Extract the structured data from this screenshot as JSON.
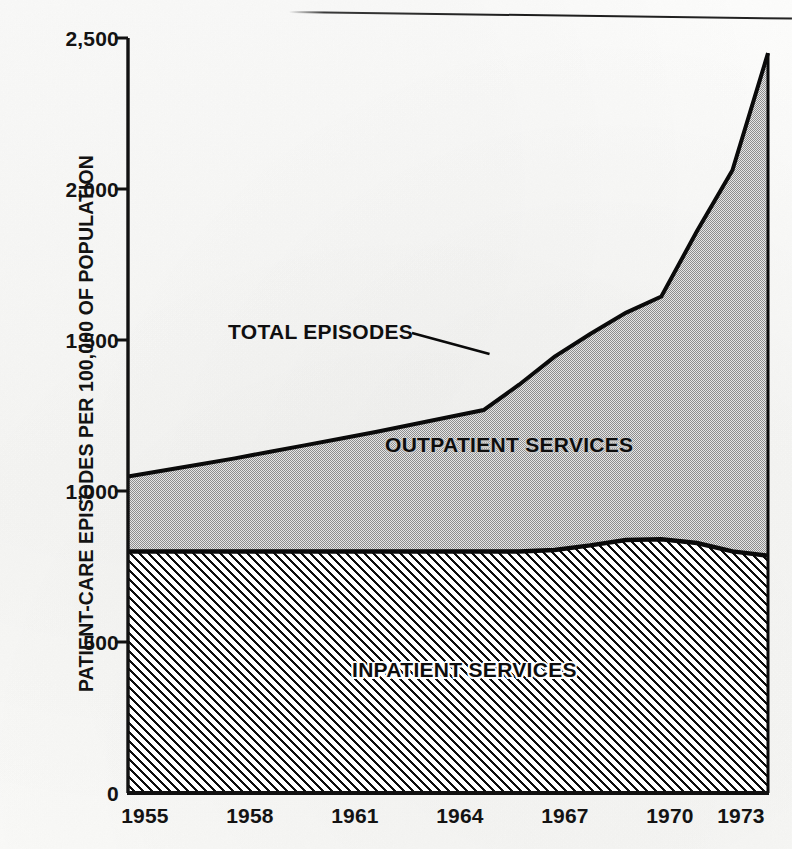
{
  "chart_data": {
    "type": "area",
    "title": "",
    "subtitle": "",
    "xlabel": "",
    "ylabel": "PATIENT-CARE EPISODES PER 100,000 OF POPULATION",
    "xlim": [
      1955,
      1973
    ],
    "ylim": [
      0,
      2500
    ],
    "grid": false,
    "legend_position": "inline-annotations",
    "stacked": true,
    "x": [
      1955,
      1956,
      1957,
      1958,
      1959,
      1960,
      1961,
      1962,
      1963,
      1964,
      1965,
      1966,
      1967,
      1968,
      1969,
      1970,
      1971,
      1972,
      1973
    ],
    "x_tick_labels": [
      "1955",
      "1958",
      "1961",
      "1964",
      "1967",
      "1970",
      "1973"
    ],
    "x_tick_values": [
      1955,
      1958,
      1961,
      1964,
      1967,
      1970,
      1973
    ],
    "y_tick_labels": [
      "0",
      "500",
      "1,000",
      "1,500",
      "2,000",
      "2,500"
    ],
    "y_tick_values": [
      0,
      500,
      1000,
      1500,
      2000,
      2500
    ],
    "series": [
      {
        "name": "INPATIENT SERVICES",
        "fill": "diagonal-hatch",
        "color": "#000000",
        "values": [
          800,
          800,
          800,
          800,
          800,
          800,
          800,
          800,
          800,
          800,
          800,
          800,
          805,
          820,
          838,
          840,
          828,
          800,
          786
        ]
      },
      {
        "name": "OUTPATIENT SERVICES",
        "fill": "grey-stipple",
        "color": "#b7b7b7",
        "values": [
          248,
          268,
          288,
          308,
          330,
          352,
          374,
          396,
          420,
          444,
          468,
          552,
          640,
          700,
          752,
          804,
          1032,
          1262,
          1664
        ]
      }
    ],
    "total_series": {
      "name": "TOTAL EPISODES",
      "values": [
        1048,
        1068,
        1088,
        1108,
        1130,
        1152,
        1174,
        1196,
        1220,
        1244,
        1268,
        1352,
        1445,
        1520,
        1590,
        1644,
        1860,
        2062,
        2450
      ]
    },
    "annotations": [
      {
        "name": "total-episodes-callout",
        "text": "TOTAL EPISODES",
        "target_x": 1965,
        "target_y": 1460,
        "has_leader_line": true
      },
      {
        "name": "outpatient-band-label",
        "text": "OUTPATIENT SERVICES",
        "target_x": 1964,
        "target_y": 1080
      },
      {
        "name": "inpatient-band-label",
        "text": "INPATIENT SERVICES",
        "target_x": 1963,
        "target_y": 400
      }
    ],
    "colors": {
      "axis": "#111111",
      "outline": "#0a0a0a",
      "outpatient_fill": "#b9b9b9",
      "inpatient_fill": "#ffffff",
      "paper": "#fbfbfa",
      "text": "#131313"
    }
  },
  "axis": {
    "y_ticks": [
      {
        "label": "2,500",
        "value": 2500
      },
      {
        "label": "2,000",
        "value": 2000
      },
      {
        "label": "1,500",
        "value": 1500
      },
      {
        "label": "1,000",
        "value": 1000
      },
      {
        "label": "500",
        "value": 500
      },
      {
        "label": "0",
        "value": 0
      }
    ],
    "x_ticks": [
      {
        "label": "1955",
        "value": 1955
      },
      {
        "label": "1958",
        "value": 1958
      },
      {
        "label": "1961",
        "value": 1961
      },
      {
        "label": "1964",
        "value": 1964
      },
      {
        "label": "1967",
        "value": 1967
      },
      {
        "label": "1970",
        "value": 1970
      },
      {
        "label": "1973",
        "value": 1973
      }
    ],
    "y_title": "PATIENT-CARE EPISODES PER 100,000 OF POPULATION"
  },
  "labels": {
    "total_episodes": "TOTAL EPISODES",
    "outpatient_services": "OUTPATIENT SERVICES",
    "inpatient_services": "INPATIENT SERVICES"
  }
}
